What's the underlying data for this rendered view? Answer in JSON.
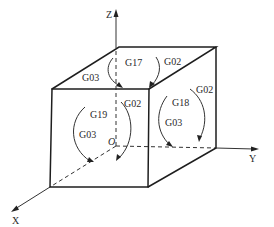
{
  "figure": {
    "type": "3d-cube-plane-selection",
    "axes": {
      "x_label": "X",
      "y_label": "Y",
      "z_label": "Z",
      "origin_label": "O"
    },
    "planes": [
      {
        "code": "G17",
        "face": "top",
        "arc_labels": {
          "cw": "G02",
          "ccw": "G03"
        }
      },
      {
        "code": "G18",
        "face": "right",
        "arc_labels": {
          "cw": "G02",
          "ccw": "G03"
        }
      },
      {
        "code": "G19",
        "face": "front",
        "arc_labels": {
          "cw": "G02",
          "ccw": "G03"
        }
      }
    ]
  }
}
